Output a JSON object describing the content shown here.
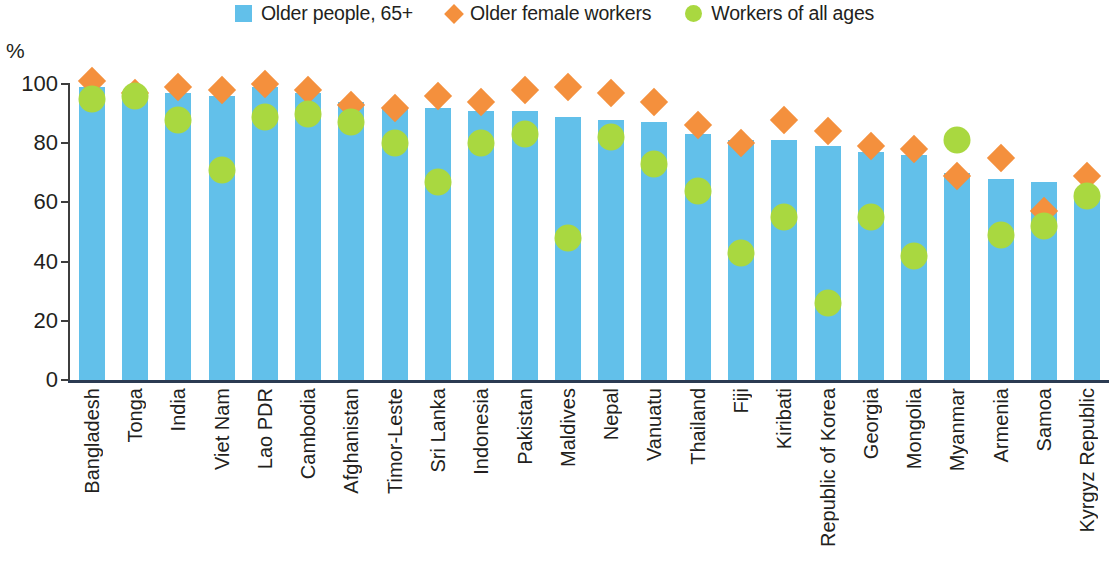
{
  "legend": {
    "items": [
      {
        "label": "Older people, 65+",
        "marker": "square",
        "color": "#62c0ea"
      },
      {
        "label": "Older female workers",
        "marker": "diamond",
        "color": "#f4903d"
      },
      {
        "label": "Workers of all ages",
        "marker": "circle",
        "color": "#a9d840"
      }
    ]
  },
  "axis": {
    "unit_label": "%",
    "yticks": [
      "0",
      "20",
      "40",
      "60",
      "80",
      "100"
    ]
  },
  "chart_data": {
    "type": "bar",
    "title": "",
    "subtitle": "",
    "xlabel": "",
    "ylabel": "%",
    "ylim": [
      0,
      100
    ],
    "yticks": [
      0,
      20,
      40,
      60,
      80,
      100
    ],
    "grid": false,
    "legend_position": "top-center",
    "categories": [
      "Bangladesh",
      "Tonga",
      "India",
      "Viet Nam",
      "Lao PDR",
      "Cambodia",
      "Afghanistan",
      "Timor-Leste",
      "Sri Lanka",
      "Indonesia",
      "Pakistan",
      "Maldives",
      "Nepal",
      "Vanuatu",
      "Thailand",
      "Fiji",
      "Kiribati",
      "Republic of Korea",
      "Georgia",
      "Mongolia",
      "Myanmar",
      "Armenia",
      "Samoa",
      "Kyrgyz Republic"
    ],
    "series": [
      {
        "name": "Older people, 65+",
        "type": "bar",
        "color": "#62c0ea",
        "values": [
          99,
          97,
          97,
          96,
          99,
          97,
          94,
          92,
          92,
          91,
          91,
          89,
          88,
          87,
          83,
          81,
          81,
          79,
          77,
          76,
          70,
          68,
          67,
          63
        ]
      },
      {
        "name": "Older female workers",
        "type": "diamond",
        "color": "#f4903d",
        "values": [
          101,
          97,
          99,
          98,
          100,
          98,
          93,
          92,
          96,
          94,
          98,
          99,
          97,
          94,
          86,
          80,
          88,
          84,
          79,
          78,
          69,
          75,
          57,
          69
        ]
      },
      {
        "name": "Workers of all ages",
        "type": "circle",
        "color": "#a9d840",
        "values": [
          95,
          96,
          88,
          71,
          89,
          90,
          87,
          80,
          67,
          80,
          83,
          48,
          82,
          73,
          64,
          43,
          55,
          26,
          55,
          42,
          81,
          49,
          52,
          62
        ]
      }
    ]
  }
}
